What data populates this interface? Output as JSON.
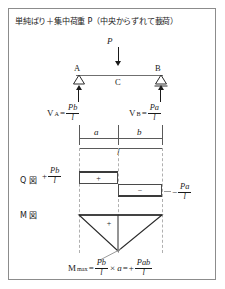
{
  "figure": {
    "title": "単純ばり＋集中荷重 P（中央からずれて載荷）",
    "border_color": "#8c8c8c",
    "background": "#ffffff"
  },
  "beam": {
    "load_label": "P",
    "support_left_label": "A",
    "support_right_label": "B",
    "load_point_label": "C",
    "reaction_left": {
      "symbol": "V",
      "subscript": "A",
      "equals": "=",
      "numerator": "Pb",
      "denominator": "l"
    },
    "reaction_right": {
      "symbol": "V",
      "subscript": "B",
      "equals": "=",
      "numerator": "Pa",
      "denominator": "l"
    }
  },
  "dimensions": {
    "left_segment": "a",
    "right_segment": "b",
    "total_span": "l"
  },
  "shear_diagram": {
    "label": "Q 図",
    "positive_value": {
      "sign": "+",
      "numerator": "Pb",
      "denominator": "l"
    },
    "negative_value": {
      "sign": "−",
      "numerator": "Pa",
      "denominator": "l"
    },
    "positive_block_sign": "+",
    "negative_block_sign": "−"
  },
  "moment_diagram": {
    "label": "M 図",
    "area_sign": "+",
    "max_moment": {
      "symbol": "M",
      "subscript": "max",
      "equals": "=",
      "term1_numerator": "Pb",
      "term1_denominator": "l",
      "times": "×",
      "multiplier": "a",
      "equals2": "=",
      "result_sign": "+",
      "result_numerator": "Pab",
      "result_denominator": "l"
    }
  },
  "colors": {
    "beam_line": "#6f6f6f",
    "diagram_outline": "#4a4a4a",
    "dashed_guide": "#b0b0b0",
    "ink": "#1a1a1a"
  }
}
